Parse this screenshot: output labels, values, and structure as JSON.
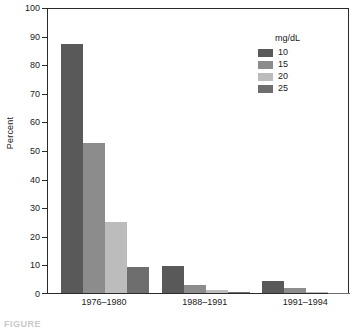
{
  "chart_data": {
    "type": "bar",
    "title": "",
    "subtitle": "",
    "xlabel": "",
    "ylabel": "Percent",
    "ylim": [
      0,
      100
    ],
    "yticks": [
      0,
      10,
      20,
      30,
      40,
      50,
      60,
      70,
      80,
      90,
      100
    ],
    "ytick_labels": [
      "0",
      "10",
      "20",
      "30",
      "40",
      "50",
      "60",
      "70",
      "80",
      "90",
      "100"
    ],
    "grid": false,
    "legend_position": "top-right",
    "legend_title": "mg/dL",
    "categories": [
      "1976–1980",
      "1988–1991",
      "1991–1994"
    ],
    "series": [
      {
        "name": "10",
        "color": "#595959",
        "values": [
          87.2,
          9.3,
          4.1
        ]
      },
      {
        "name": "15",
        "color": "#8c8c8c",
        "values": [
          52.6,
          2.9,
          1.9
        ]
      },
      {
        "name": "20",
        "color": "#bcbcbc",
        "values": [
          24.9,
          1.1,
          0.2
        ]
      },
      {
        "name": "25",
        "color": "#6e6e6e",
        "values": [
          9.0,
          0.4,
          0.1
        ]
      }
    ]
  },
  "caption_sliver": "FIGURE"
}
